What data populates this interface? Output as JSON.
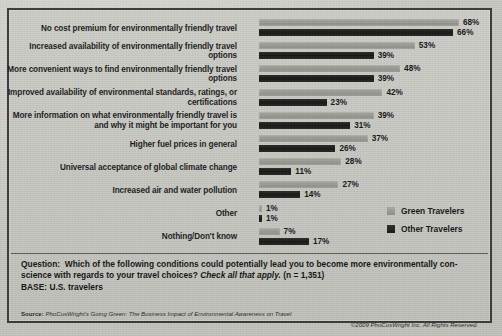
{
  "chart_data": {
    "type": "bar",
    "orientation": "horizontal",
    "title": "",
    "xlabel": "",
    "ylabel": "",
    "xlim": [
      0,
      70
    ],
    "grid": false,
    "legend_position": "inside-right-lower",
    "categories": [
      "No cost premium for environmentally friendly travel",
      "Increased availability of environmentally friendly travel options",
      "More convenient ways to find environmentally friendly travel options",
      "Improved availability of environmental standards, ratings, or certifications",
      "More information on what environmentally friendly travel is and why it might be important for you",
      "Higher fuel prices in general",
      "Universal acceptance of global climate change",
      "Increased air and water pollution",
      "Other",
      "Nothing/Don't know"
    ],
    "series": [
      {
        "name": "Green Travelers",
        "color": "#9a9a95",
        "values": [
          68,
          53,
          48,
          42,
          39,
          37,
          28,
          27,
          1,
          7
        ],
        "labels": [
          "68%",
          "53%",
          "48%",
          "42%",
          "39%",
          "37%",
          "28%",
          "27%",
          "1%",
          "7%"
        ]
      },
      {
        "name": "Other Travelers",
        "color": "#1a1a19",
        "values": [
          66,
          39,
          39,
          23,
          31,
          26,
          11,
          14,
          1,
          17
        ],
        "labels": [
          "66%",
          "39%",
          "39%",
          "23%",
          "31%",
          "26%",
          "11%",
          "14%",
          "1%",
          "17%"
        ]
      }
    ]
  },
  "legend": {
    "items": [
      {
        "label": "Green Travelers",
        "color": "#9a9a95"
      },
      {
        "label": "Other Travelers",
        "color": "#1a1a19"
      }
    ]
  },
  "footer": {
    "question_prefix": "Question:",
    "question_text": "Which of the following conditions could potentially lead you to become more environmentally con-science with regards to your travel choices?",
    "question_emphasis": "Check all that apply.",
    "sample_size": "(n = 1,351)",
    "base": "BASE: U.S. travelers",
    "source_key": "Source:",
    "source_value": "PhoCusWright's Going Green: The Business Impact of Environmental Awareness on Travel",
    "copyright": "©2009 PhoCusWright Inc. All Rights Reserved."
  }
}
